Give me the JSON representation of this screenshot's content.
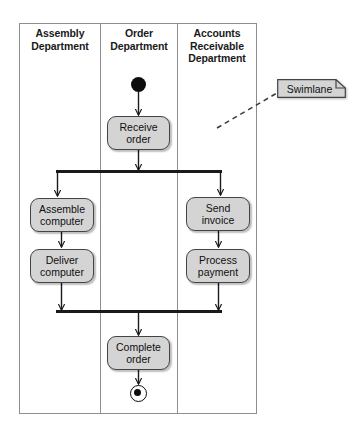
{
  "diagram": {
    "type": "uml-activity-diagram-with-swimlanes",
    "lanes": [
      {
        "id": "assembly",
        "label": "Assembly\nDepartment",
        "line1": "Assembly",
        "line2": "Department"
      },
      {
        "id": "order",
        "label": "Order\nDepartment",
        "line1": "Order",
        "line2": "Department"
      },
      {
        "id": "accounts",
        "label": "Accounts\nReceivable\nDepartment",
        "line1": "Accounts",
        "line2": "Receivable",
        "line3": "Department"
      }
    ],
    "nodes": [
      {
        "id": "start",
        "kind": "initial-node",
        "lane": "order",
        "label": ""
      },
      {
        "id": "receive-order",
        "kind": "action",
        "lane": "order",
        "line1": "Receive",
        "line2": "order"
      },
      {
        "id": "fork",
        "kind": "fork-bar",
        "label": ""
      },
      {
        "id": "assemble-computer",
        "kind": "action",
        "lane": "assembly",
        "line1": "Assemble",
        "line2": "computer"
      },
      {
        "id": "send-invoice",
        "kind": "action",
        "lane": "accounts",
        "line1": "Send",
        "line2": "invoice"
      },
      {
        "id": "deliver-computer",
        "kind": "action",
        "lane": "assembly",
        "line1": "Deliver",
        "line2": "computer"
      },
      {
        "id": "process-payment",
        "kind": "action",
        "lane": "accounts",
        "line1": "Process",
        "line2": "payment"
      },
      {
        "id": "join",
        "kind": "join-bar",
        "label": ""
      },
      {
        "id": "complete-order",
        "kind": "action",
        "lane": "order",
        "line1": "Complete",
        "line2": "order"
      },
      {
        "id": "end",
        "kind": "final-node",
        "lane": "order",
        "label": ""
      }
    ],
    "annotations": [
      {
        "id": "swimlane-note",
        "kind": "note",
        "label": "Swimlane",
        "points_to": "lane-boundary"
      }
    ],
    "colors": {
      "node_fill": "#d4d4d4",
      "node_stroke": "#444444",
      "lane_stroke": "#8e8e8e",
      "flow_stroke": "#1a1a1a",
      "note_fill": "#d4d4d4",
      "background": "#ffffff"
    }
  }
}
